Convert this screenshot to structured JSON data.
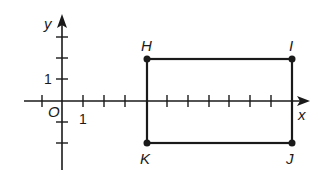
{
  "diagram": {
    "type": "coordinate-plane-rectangle",
    "axes": {
      "x_label": "x",
      "y_label": "y",
      "origin_label": "O",
      "x_unit_label": "1",
      "y_unit_label": "1",
      "x_ticks": [
        -1,
        1,
        2,
        3,
        5,
        6,
        7,
        8,
        9,
        10
      ],
      "y_ticks": [
        -2,
        -1,
        1,
        2,
        3
      ]
    },
    "rectangle": {
      "vertices": [
        {
          "name": "H",
          "x": 4,
          "y": 2
        },
        {
          "name": "I",
          "x": 11,
          "y": 2
        },
        {
          "name": "J",
          "x": 11,
          "y": -2
        },
        {
          "name": "K",
          "x": 4,
          "y": -2
        }
      ],
      "stroke_color": "#1a1a1a"
    }
  }
}
